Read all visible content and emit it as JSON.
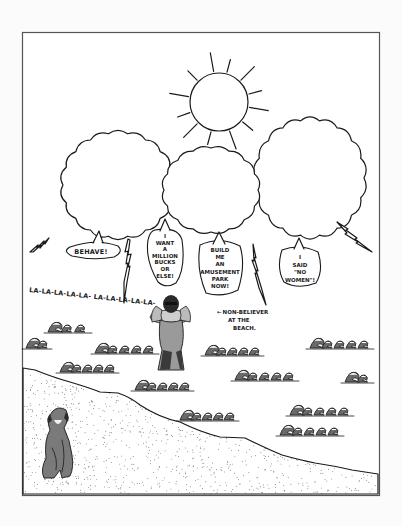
{
  "illustration": {
    "title": "Cartoon: non-believer at the beach",
    "speech_bubbles": [
      {
        "id": "behave",
        "lines": [
          "BEHAVE!"
        ]
      },
      {
        "id": "million",
        "lines": [
          "I",
          "WANT",
          "A",
          "MILLION",
          "BUCKS",
          "OR",
          "ELSE!"
        ]
      },
      {
        "id": "park",
        "lines": [
          "BUILD",
          "ME",
          "AN",
          "AMUSEMENT",
          "PARK",
          "NOW!"
        ]
      },
      {
        "id": "women",
        "lines": [
          "I",
          "SAID",
          "\"NO",
          "WOMEN\"!"
        ]
      }
    ],
    "chant": "LA-LA-LA-LA-LA- LA-LA-LA-LA-LA-",
    "caption_arrow": "←",
    "caption_lines": [
      "NON-BELIEVER",
      "AT THE",
      "BEACH."
    ],
    "colors": {
      "ink": "#1a1a1a",
      "paper": "#ffffff",
      "frame": "#555555",
      "sand_dot": "#333333"
    }
  }
}
